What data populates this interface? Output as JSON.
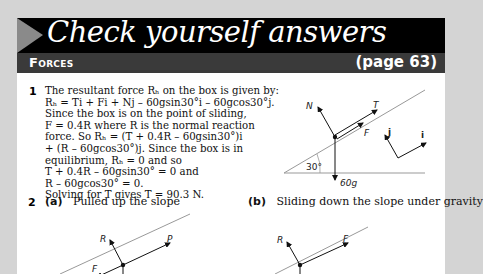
{
  "header": {
    "title": "Check yourself answers",
    "section": "Forces",
    "page_ref": "(page 63)"
  },
  "question1": {
    "number": "1",
    "lines": [
      "The resultant force Rₕ on the box is given by:",
      "Rₕ = Ti + Fi + Nj – 60gsin30°i – 60gcos30°j.",
      "Since the box is on the point of sliding,",
      "F = 0.4R where R is the normal reaction",
      "force. So Rₕ = (T + 0.4R – 60gsin30°)i",
      "+ (R – 60gcos30°)j. Since the box is in",
      "equilibrium, Rₕ = 0 and so",
      "T + 0.4R – 60gsin30° = 0 and",
      "R – 60gcos30° = 0.",
      "Solving for T gives T = 90.3 N."
    ],
    "diagram": {
      "labels": {
        "normal": "N",
        "tension": "T",
        "friction": "F",
        "weight": "60g",
        "angle": "30°",
        "unit_i": "i",
        "unit_j": "j"
      }
    }
  },
  "question2": {
    "number": "2",
    "part_a": {
      "label": "(a)",
      "text": "Pulled up the slope",
      "labels": {
        "normal": "R",
        "pull": "P",
        "friction": "F"
      }
    },
    "part_b": {
      "label": "(b)",
      "text": "Sliding down the slope under gravity",
      "labels": {
        "normal": "R",
        "friction": "F"
      }
    }
  }
}
